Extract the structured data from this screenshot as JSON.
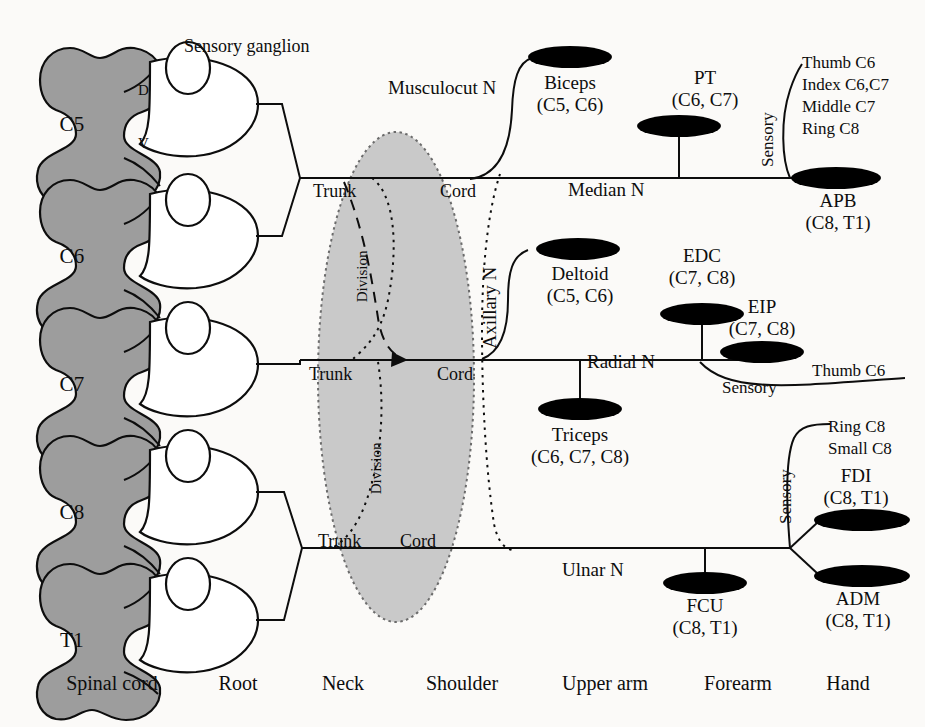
{
  "figure": {
    "background_color": "#fbfaf8",
    "ink_color": "#0d0d0d",
    "segment_fill": "#9d9d9d",
    "plexus_fill": "#c9c9c9",
    "muscle_fill": "#000000"
  },
  "spinal_segments": [
    {
      "label": "C5",
      "dorsal": "D",
      "ventral": "V"
    },
    {
      "label": "C6",
      "dorsal": "",
      "ventral": ""
    },
    {
      "label": "C7",
      "dorsal": "",
      "ventral": ""
    },
    {
      "label": "C8",
      "dorsal": "",
      "ventral": ""
    },
    {
      "label": "T1",
      "dorsal": "",
      "ventral": ""
    }
  ],
  "annotations": {
    "sensory_ganglion": "Sensory ganglion",
    "dorsal_marker": "D",
    "ventral_marker": "V"
  },
  "plexus": {
    "trunk_label": "Trunk",
    "cord_label": "Cord",
    "division_label": "Division",
    "trunks": [
      "Trunk",
      "Trunk",
      "Trunk"
    ],
    "cords": [
      "Cord",
      "Cord",
      "Cord"
    ],
    "divisions": [
      "Division",
      "Division"
    ]
  },
  "nerves": [
    {
      "name": "Musculocut N"
    },
    {
      "name": "Median N"
    },
    {
      "name": "Axillary N"
    },
    {
      "name": "Radial N"
    },
    {
      "name": "Ulnar N"
    }
  ],
  "muscles": [
    {
      "name": "Biceps",
      "roots": "(C5, C6)"
    },
    {
      "name": "PT",
      "roots": "(C6, C7)"
    },
    {
      "name": "APB",
      "roots": "(C8, T1)"
    },
    {
      "name": "Deltoid",
      "roots": "(C5, C6)"
    },
    {
      "name": "EDC",
      "roots": "(C7, C8)"
    },
    {
      "name": "EIP",
      "roots": "(C7, C8)"
    },
    {
      "name": "Triceps",
      "roots": "(C6, C7, C8)"
    },
    {
      "name": "FDI",
      "roots": "(C8, T1)"
    },
    {
      "name": "ADM",
      "roots": "(C8, T1)"
    },
    {
      "name": "FCU",
      "roots": "(C8, T1)"
    }
  ],
  "sensory": {
    "label": "Sensory",
    "median_branches": [
      "Thumb C6",
      "Index C6,C7",
      "Middle C7",
      "Ring C8"
    ],
    "radial_branches": [
      "Thumb C6"
    ],
    "ulnar_branches": [
      "Ring C8",
      "Small C8"
    ],
    "median_label": "Sensory",
    "radial_label": "Sensory",
    "ulnar_label": "Sensory"
  },
  "regions": [
    {
      "label": "Spinal cord"
    },
    {
      "label": "Root"
    },
    {
      "label": "Neck"
    },
    {
      "label": "Shoulder"
    },
    {
      "label": "Upper arm"
    },
    {
      "label": "Forearm"
    },
    {
      "label": "Hand"
    }
  ]
}
